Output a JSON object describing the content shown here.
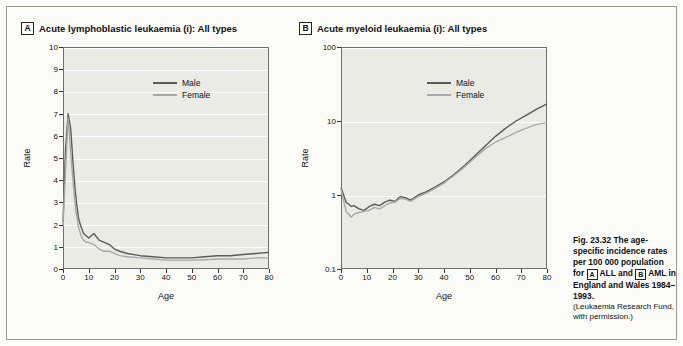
{
  "figure": {
    "caption_bold": "Fig. 23.32   The age-specific incidence rates per 100 000 population for",
    "caption_tag_a": "A",
    "caption_mid": "ALL and",
    "caption_tag_b": "B",
    "caption_end": "AML in England and Wales 1984–1993.",
    "caption_permission": "(Leukaemia Research Fund, with permission.)",
    "colors": {
      "male": "#5a5a5a",
      "female": "#a8a8a8",
      "plot_background": "#ebebe6",
      "gridline": "#ffffff",
      "frame": "#6f6f6a"
    }
  },
  "chart_data": [
    {
      "type": "line",
      "panel_tag": "A",
      "title": "Acute lymphoblastic leukaemia (i): All types",
      "xlabel": "Age",
      "ylabel": "Rate",
      "yscale": "linear",
      "ylim": [
        0,
        10
      ],
      "xlim": [
        0,
        80
      ],
      "yticks": [
        0,
        1,
        2,
        3,
        4,
        5,
        6,
        7,
        8,
        9,
        10
      ],
      "xticks": [
        0,
        10,
        20,
        30,
        40,
        50,
        60,
        70,
        80
      ],
      "grid": true,
      "legend": [
        "Male",
        "Female"
      ],
      "legend_position": "top-center",
      "x": [
        0,
        1,
        2,
        3,
        4,
        5,
        6,
        7,
        8,
        9,
        10,
        12,
        14,
        16,
        18,
        20,
        22,
        25,
        30,
        35,
        40,
        45,
        50,
        55,
        60,
        65,
        70,
        75,
        80
      ],
      "series": [
        {
          "name": "Male",
          "values": [
            2.1,
            5.4,
            7.0,
            6.3,
            4.6,
            3.2,
            2.3,
            1.9,
            1.6,
            1.5,
            1.4,
            1.6,
            1.3,
            1.2,
            1.1,
            0.9,
            0.8,
            0.7,
            0.6,
            0.55,
            0.5,
            0.5,
            0.5,
            0.55,
            0.6,
            0.6,
            0.65,
            0.7,
            0.75
          ]
        },
        {
          "name": "Female",
          "values": [
            1.9,
            4.5,
            6.8,
            5.2,
            3.8,
            2.6,
            1.9,
            1.5,
            1.3,
            1.2,
            1.2,
            1.1,
            0.9,
            0.8,
            0.8,
            0.7,
            0.6,
            0.55,
            0.5,
            0.45,
            0.4,
            0.4,
            0.4,
            0.42,
            0.45,
            0.45,
            0.45,
            0.5,
            0.5
          ]
        }
      ]
    },
    {
      "type": "line",
      "panel_tag": "B",
      "title": "Acute myeloid leukaemia (i): All types",
      "xlabel": "Age",
      "ylabel": "Rate",
      "yscale": "log",
      "ylim": [
        0.1,
        100
      ],
      "xlim": [
        0,
        80
      ],
      "yticks": [
        0.1,
        1,
        10,
        100
      ],
      "ytick_labels": [
        "0.1",
        "1",
        "10",
        "100"
      ],
      "xticks": [
        0,
        10,
        20,
        30,
        40,
        50,
        60,
        70,
        80
      ],
      "grid": true,
      "legend": [
        "Male",
        "Female"
      ],
      "legend_position": "top-center",
      "x": [
        0,
        1,
        2,
        3,
        4,
        5,
        7,
        9,
        11,
        13,
        15,
        17,
        19,
        21,
        23,
        25,
        27,
        30,
        33,
        36,
        40,
        44,
        48,
        52,
        56,
        60,
        64,
        68,
        72,
        76,
        80
      ],
      "series": [
        {
          "name": "Male",
          "values": [
            1.25,
            1.0,
            0.8,
            0.75,
            0.7,
            0.72,
            0.65,
            0.62,
            0.7,
            0.75,
            0.72,
            0.8,
            0.85,
            0.82,
            0.95,
            0.92,
            0.85,
            1.0,
            1.1,
            1.25,
            1.5,
            1.9,
            2.5,
            3.4,
            4.6,
            6.2,
            8.0,
            10.0,
            12.0,
            14.5,
            17.0
          ]
        },
        {
          "name": "Female",
          "values": [
            1.2,
            0.85,
            0.6,
            0.55,
            0.5,
            0.55,
            0.58,
            0.6,
            0.62,
            0.68,
            0.65,
            0.72,
            0.78,
            0.8,
            0.9,
            0.88,
            0.82,
            0.95,
            1.05,
            1.2,
            1.45,
            1.85,
            2.4,
            3.2,
            4.2,
            5.2,
            6.0,
            7.0,
            8.0,
            9.0,
            9.5
          ]
        }
      ]
    }
  ]
}
